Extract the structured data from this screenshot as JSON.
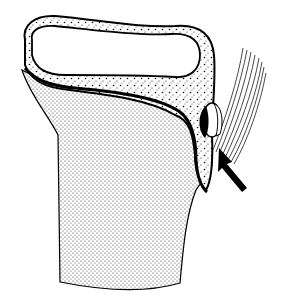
{
  "figure": {
    "type": "anatomical-line-drawing",
    "width": 281,
    "height": 299,
    "background": "#ffffff",
    "ink": "#000000",
    "elements": [
      {
        "name": "bone-shaft",
        "fill": "stipple-fine"
      },
      {
        "name": "cortical-shell",
        "fill": "stipple-coarse"
      },
      {
        "name": "medullary-cavity",
        "fill": "#ffffff"
      },
      {
        "name": "tendon-fibers",
        "fill": "striated"
      },
      {
        "name": "lesion-nodule",
        "fill": "#000000"
      },
      {
        "name": "pointer-arrow",
        "fill": "#000000"
      }
    ]
  }
}
